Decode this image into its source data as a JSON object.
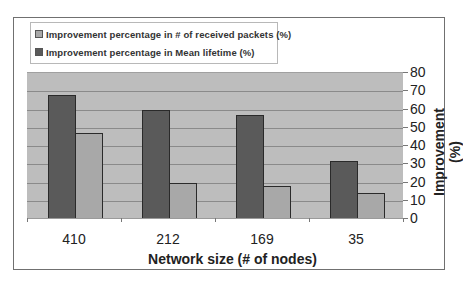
{
  "chart_data": {
    "type": "bar",
    "title": "",
    "categories": [
      "410",
      "212",
      "169",
      "35"
    ],
    "series": [
      {
        "name": "Improvement percentage in  Mean lifetime (%)",
        "color": "#5a5a5a",
        "values": [
          68,
          60,
          57,
          32
        ]
      },
      {
        "name": "Improvement percentage in # of received packets (%)",
        "color": "#a8a8a8",
        "values": [
          47,
          20,
          18,
          14
        ]
      }
    ],
    "xlabel": "Network size (# of nodes)",
    "ylabel": "Improvement (%)",
    "ylim": [
      0,
      80
    ],
    "yticks": [
      "0",
      "10",
      "20",
      "30",
      "40",
      "50",
      "60",
      "70",
      "80"
    ],
    "grid": true,
    "legend_position": "top-left",
    "y_axis_side": "right"
  },
  "legend": {
    "items": [
      {
        "label": "Improvement percentage in # of received packets (%)",
        "color": "#a8a8a8"
      },
      {
        "label": "Improvement percentage in  Mean lifetime (%)",
        "color": "#5a5a5a"
      }
    ]
  }
}
